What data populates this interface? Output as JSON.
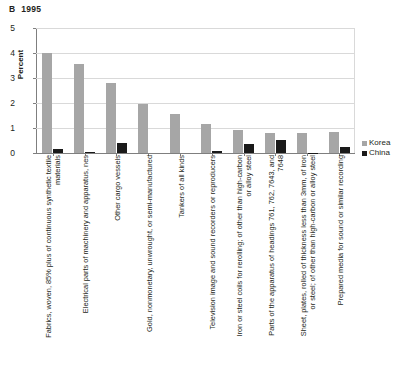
{
  "panel": {
    "letter": "B",
    "year": "1995"
  },
  "legend": {
    "position": "right",
    "entries": [
      {
        "label": "Korea",
        "color": "#a6a6a6"
      },
      {
        "label": "China",
        "color": "#1a1a1a"
      }
    ]
  },
  "chart_data": {
    "type": "bar",
    "xlabel": "",
    "ylabel": "Percent",
    "ylim": [
      0,
      5
    ],
    "yticks": [
      0,
      1,
      2,
      3,
      4,
      5
    ],
    "ytick_labels": [
      "0",
      "1",
      "2",
      "3",
      "4",
      "5"
    ],
    "grid": true,
    "grid_axis": "y",
    "legend_position": "right",
    "categories": [
      "Fabrics, woven, 85% plus of continuous synthetic textile materials",
      "Electrical parts of machinery and apparatus, nes",
      "Other cargo vessels",
      "Gold, nonmonetary, unwrought, or semi-manufactured",
      "Tankers of all kinds",
      "Television image and sound recorders or reproducers",
      "Iron or steel coils for rerolling; of other than high-carbon or alloy steel",
      "Parts of the apparatus of headings 761, 762, 7643, and 7648",
      "Sheet, plates, rolled of thickness less than 3mm, of iron or steel; of other than high-carbon or alloy steel",
      "Prepared media for sound or similar recording"
    ],
    "series": [
      {
        "name": "Korea",
        "color": "#a6a6a6",
        "values": [
          4.0,
          3.55,
          2.82,
          1.98,
          1.55,
          1.18,
          0.92,
          0.82,
          0.82,
          0.85
        ]
      },
      {
        "name": "China",
        "color": "#1a1a1a",
        "values": [
          0.17,
          0.05,
          0.4,
          0.0,
          0.0,
          0.08,
          0.35,
          0.52,
          0.02,
          0.25
        ]
      }
    ]
  }
}
